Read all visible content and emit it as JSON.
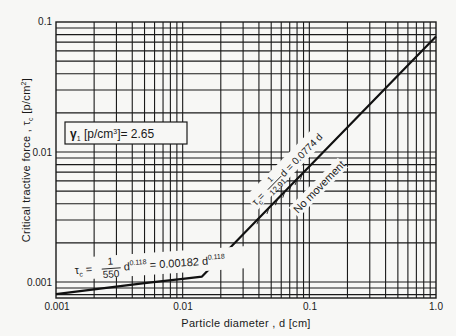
{
  "chart_data": {
    "type": "line",
    "title": "",
    "xlabel": "Particle diameter , d [cm]",
    "ylabel": "Critical tractive force , τc [p/cm²]",
    "xscale": "log",
    "yscale": "log",
    "xlim": [
      0.001,
      1.0
    ],
    "ylim": [
      0.00075,
      0.1
    ],
    "x_ticks": [
      "0.001",
      "0.01",
      "0.1",
      "1.0"
    ],
    "y_ticks": [
      "0.001",
      "0.01",
      "0.1"
    ],
    "grid": true,
    "series": [
      {
        "name": "τc = (1/550) d^0.118 = 0.00182 d^0.118",
        "x": [
          0.001,
          0.002,
          0.005,
          0.01,
          0.0142
        ],
        "values": [
          0.000806,
          0.000879,
          0.00098,
          0.001057,
          0.0011
        ]
      },
      {
        "name": "τc = (1/12.91) d = 0.0774 d",
        "x": [
          0.0142,
          0.02,
          0.05,
          0.1,
          0.2,
          0.5,
          1.0
        ],
        "values": [
          0.0011,
          0.00155,
          0.00387,
          0.00774,
          0.0155,
          0.0387,
          0.0774
        ]
      }
    ],
    "annotations": [
      "γ1 [p/cm³] = 2.65",
      "τc = 1/550 d^0.118 = 0.00182 d^0.118",
      "τc = 1/12.91 d = 0.0774 d",
      "No movement"
    ]
  },
  "labels": {
    "x_ticks": [
      "0.001",
      "0.01",
      "0.1",
      "1.0"
    ],
    "y_ticks": [
      "0.1",
      "0.01",
      "0.001"
    ],
    "xlabel": "Particle diameter , d [cm]",
    "ylabel_main": "Critical tractive force , τ",
    "ylabel_sub": "c",
    "ylabel_unit": " [p/cm",
    "ylabel_sup": "2",
    "ylabel_close": "]",
    "gamma_sym": "γ",
    "gamma_sub": "1",
    "gamma_unit": " [p/cm",
    "gamma_sup": "3",
    "gamma_val": "]= 2.65",
    "f1_tau": "τ",
    "f1_sub": "c",
    "f1_eq": " = ",
    "f1_num": "1",
    "f1_den": "550",
    "f1_d": "d",
    "f1_exp": "0.118",
    "f1_rhs": " = 0.00182 d",
    "f1_exp2": "0.118",
    "f2_tau": "τ",
    "f2_sub": "c",
    "f2_eq": "= ",
    "f2_num": "1",
    "f2_den": "12.91",
    "f2_rhs": " d = 0.0774 d",
    "no_movement": "No movement"
  }
}
